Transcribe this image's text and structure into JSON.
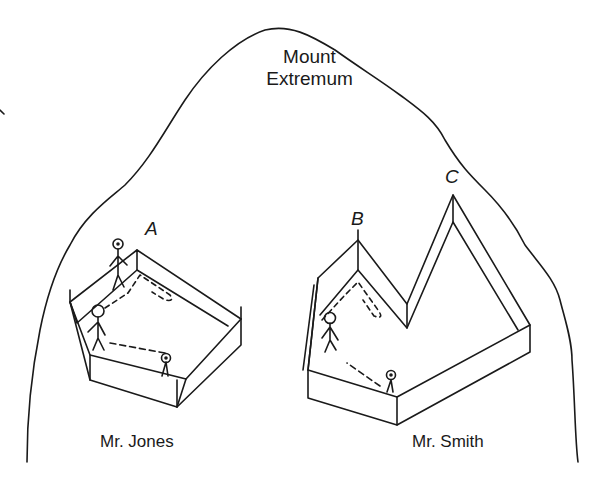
{
  "title": {
    "line1": "Mount",
    "line2": "Extremum"
  },
  "points": {
    "a": "A",
    "b": "B",
    "c": "C"
  },
  "owners": {
    "left": "Mr. Jones",
    "right": "Mr. Smith"
  },
  "colors": {
    "ink": "#1a1a1a",
    "background": "#ffffff"
  }
}
